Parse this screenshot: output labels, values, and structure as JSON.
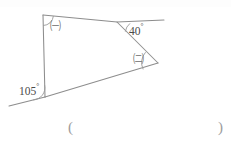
{
  "figure": {
    "type": "geometry-angle-diagram",
    "background_color": "#ffffff",
    "line_color": "#8d8d8d",
    "label_color": "#4a4a4a",
    "labels": {
      "angle_top_left": "㈠",
      "angle_top_right_value": "40",
      "angle_top_right_degree": "°",
      "angle_right_lower": "㈡",
      "angle_bottom_left_value": "105",
      "angle_bottom_left_degree": "°"
    },
    "vertices": {
      "top_left": [
        43,
        15
      ],
      "top_apex": [
        117,
        22
      ],
      "right": [
        158,
        63
      ],
      "bottom_left": [
        45,
        97
      ]
    },
    "rays": {
      "top_right_end": [
        164,
        20
      ],
      "bottom_left_end": [
        9,
        106
      ]
    }
  },
  "answer_field": {
    "open_paren": "(",
    "close_paren": ")"
  }
}
